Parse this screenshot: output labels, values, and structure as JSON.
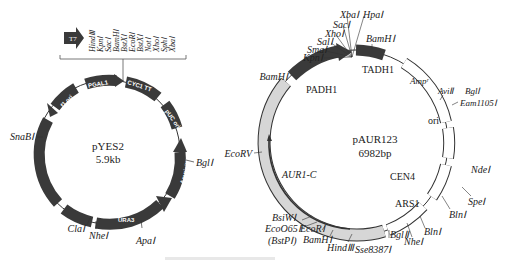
{
  "left_plasmid": {
    "name": "pYES2",
    "size": "5.9kb",
    "promoter_box": "T7",
    "mcs_sites": [
      "HindⅢ",
      "KpnⅠ",
      "SacⅠ",
      "BamHⅠ",
      "BstXⅠ",
      "EcoRⅠ",
      "BstXⅠ",
      "NotⅠ",
      "XhoⅠ",
      "SphⅠ",
      "XbaⅠ"
    ],
    "features": {
      "pgal1": "PGAL1",
      "cyc1": "CYC1 TT",
      "puc_ori": "pUC ori",
      "f1_ori": "f1 ori",
      "two_mu": "2μ ori",
      "ampicillin": "Ampicillin",
      "ura3": "URA3"
    },
    "sites": {
      "snab1": "SnaBⅠ",
      "bgl1": "BglⅠ",
      "cla1": "ClaⅠ",
      "nhe1": "NheⅠ",
      "apa1": "ApaⅠ"
    }
  },
  "right_plasmid": {
    "name": "pAUR123",
    "size": "6982bp",
    "features": {
      "padh1": "PADH1",
      "tadh1": "TADH1",
      "ampr": "Ampʳ",
      "ori": "ori",
      "cen4": "CEN4",
      "ars1": "ARS1",
      "aur1c": "AUR1-C"
    },
    "sites": {
      "xba1": "XbaⅠ",
      "hpa1": "HpaⅠ",
      "sac1": "SacⅠ",
      "xho1": "XhoⅠ",
      "sal1": "SalⅠ",
      "sma1": "SmaⅠ",
      "kpn1": "KpnⅠ",
      "bamh1_top": "BamHⅠ",
      "bamh1_left": "BamHⅠ",
      "avi2": "AviⅡ",
      "bgl1": "BglⅠ",
      "eam1105": "Eam1105Ⅰ",
      "nde1": "NdeⅠ",
      "spe1": "SpeⅠ",
      "bln1_a": "BlnⅠ",
      "bln1_b": "BlnⅠ",
      "nhe1": "NheⅠ",
      "bgl2": "BglⅡ",
      "sse8387": "Sse8387Ⅰ",
      "hind3": "HindⅢ",
      "bamh1_bottom": "BamHⅠ",
      "ecor1": "EcoRⅠ",
      "ecoo65": "EcoO65Ⅰ",
      "bstp1": "(BstPⅠ)",
      "bsiw1": "BsiWⅠ",
      "ecorv": "EcoRV"
    }
  },
  "caption": "",
  "colors": {
    "dark_feature": "#3a3a3a",
    "gray_feature": "#d6d6d6",
    "outline": "#333333"
  }
}
